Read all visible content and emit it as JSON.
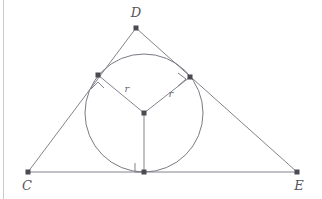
{
  "figure": {
    "background_color": "#ffffff",
    "border_color": "#c9c9cf",
    "line_color": "#83838c",
    "circle_color": "#7a7a84",
    "point_color": "#4a4a52",
    "label_color": "#55555c",
    "radius_label_color": "#6a6a72",
    "width": 322,
    "height": 199
  },
  "labels": {
    "vertex_d": "D",
    "vertex_c": "C",
    "vertex_e": "E",
    "radius_left": "r",
    "radius_right": "r"
  },
  "geometry": {
    "triangle": {
      "vertex_d": {
        "x": 136,
        "y": 28
      },
      "vertex_c": {
        "x": 28,
        "y": 172
      },
      "vertex_e": {
        "x": 297,
        "y": 172
      }
    },
    "incircle": {
      "center": {
        "x": 144,
        "y": 113
      },
      "radius": 59
    },
    "tangent_points": {
      "left": {
        "x": 98,
        "y": 75
      },
      "right": {
        "x": 190,
        "y": 77
      },
      "bottom": {
        "x": 144,
        "y": 172
      }
    },
    "radius_label_positions": {
      "left": {
        "x": 127,
        "y": 92
      },
      "right": {
        "x": 171,
        "y": 97
      }
    },
    "vertex_label_positions": {
      "d": {
        "x": 136,
        "y": 17
      },
      "c": {
        "x": 27,
        "y": 190
      },
      "e": {
        "x": 299,
        "y": 190
      }
    },
    "angle_marks": {
      "left_caret": {
        "x": 97,
        "y": 85
      },
      "right_caret": {
        "x": 182,
        "y": 84
      },
      "right_angle_square": {
        "x": 144,
        "y": 172,
        "size": 9
      }
    }
  }
}
